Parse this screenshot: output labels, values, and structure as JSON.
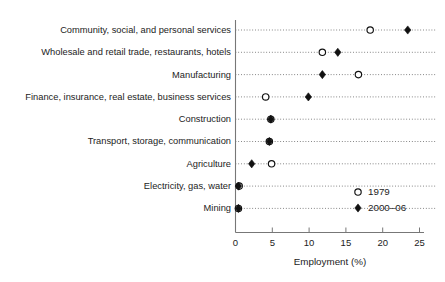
{
  "chart_data": {
    "type": "scatter",
    "title": "",
    "subtitle": "",
    "xlabel": "Employment (%)",
    "ylabel": "",
    "xlim": [
      0,
      25
    ],
    "xticks": [
      0,
      5,
      10,
      15,
      20,
      25
    ],
    "xtick_labels": [
      "0",
      "5",
      "10",
      "15",
      "20",
      "25"
    ],
    "grid": true,
    "grid_style": "dotted-horizontal",
    "legend_position": "lower-right-inside",
    "orientation": "horizontal-dot-plot",
    "categories": [
      "Community, social, and personal services",
      "Wholesale and retail trade, restaurants, hotels",
      "Manufacturing",
      "Finance, insurance, real estate, business services",
      "Construction",
      "Transport, storage, communication",
      "Agriculture",
      "Electricity, gas, water",
      "Mining"
    ],
    "series": [
      {
        "name": "1979",
        "marker": "open-circle",
        "color": "#111111",
        "values": [
          18.3,
          11.8,
          16.7,
          4.1,
          4.8,
          4.6,
          4.9,
          0.5,
          0.4
        ]
      },
      {
        "name": "2000–06",
        "marker": "filled-diamond",
        "color": "#111111",
        "values": [
          23.4,
          13.9,
          11.8,
          9.9,
          4.8,
          4.6,
          2.2,
          0.4,
          0.4
        ]
      }
    ],
    "legend": [
      {
        "label": "1979",
        "marker": "open-circle"
      },
      {
        "label": "2000–06",
        "marker": "filled-diamond"
      }
    ]
  },
  "axis": {
    "x_title": "Employment (%)"
  },
  "colors": {
    "marker_stroke": "#111111",
    "marker_open_fill": "#ffffff",
    "grid": "#2b2b2b",
    "axis": "#777777",
    "background": "#ffffff",
    "text": "#1c1c1c"
  }
}
